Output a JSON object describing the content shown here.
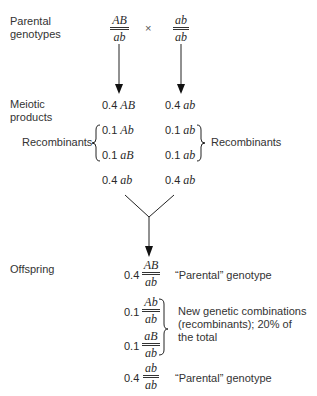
{
  "parental": {
    "label_line1": "Parental",
    "label_line2": "genotypes",
    "cross_symbol": "×",
    "left": {
      "top": "AB",
      "bottom": "ab"
    },
    "right": {
      "top": "ab",
      "bottom": "ab"
    }
  },
  "meiotic": {
    "label_line1": "Meiotic",
    "label_line2": "products",
    "left": [
      {
        "freq": "0.4",
        "genotype": "AB"
      },
      {
        "freq": "0.1",
        "genotype": "Ab"
      },
      {
        "freq": "0.1",
        "genotype": "aB"
      },
      {
        "freq": "0.4",
        "genotype": "ab"
      }
    ],
    "right": [
      {
        "freq": "0.4",
        "genotype": "ab"
      },
      {
        "freq": "0.1",
        "genotype": "ab"
      },
      {
        "freq": "0.1",
        "genotype": "ab"
      },
      {
        "freq": "0.4",
        "genotype": "ab"
      }
    ],
    "left_bracket_label": "Recombinants",
    "right_bracket_label": "Recombinants"
  },
  "offspring": {
    "label": "Offspring",
    "rows": [
      {
        "freq": "0.4",
        "top": "AB",
        "bottom": "ab",
        "note": "“Parental” genotype"
      },
      {
        "freq": "0.1",
        "top": "Ab",
        "bottom": "ab"
      },
      {
        "freq": "0.1",
        "top": "aB",
        "bottom": "ab"
      },
      {
        "freq": "0.4",
        "top": "ab",
        "bottom": "ab",
        "note": "“Parental” genotype"
      }
    ],
    "recombinant_note_line1": "New genetic combinations",
    "recombinant_note_line2": "(recombinants); 20% of",
    "recombinant_note_line3": "the total"
  }
}
